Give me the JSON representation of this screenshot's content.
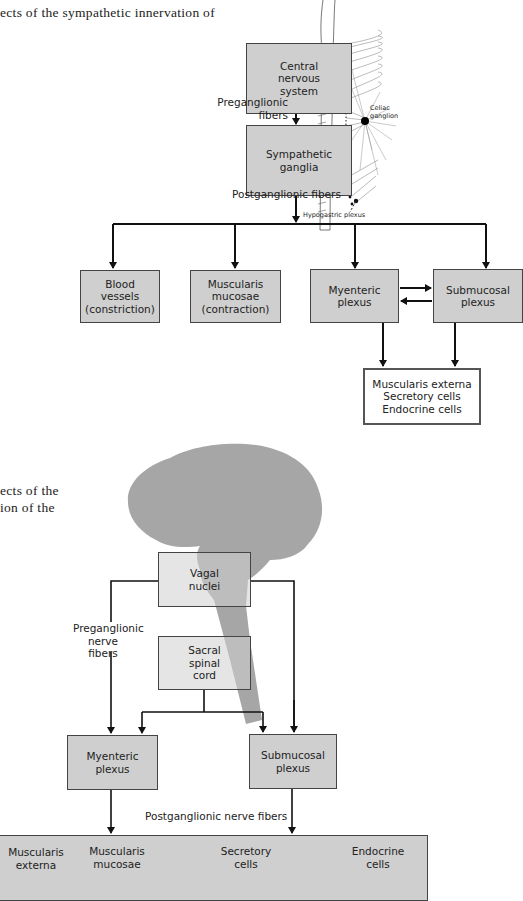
{
  "captions": {
    "top_fragment": "ects of the sympathetic innervation of",
    "bottom_fragment_line1": "ects of the",
    "bottom_fragment_line2": "ion of the"
  },
  "sympathetic_diagram": {
    "boxes": {
      "cns": "Central\nnervous\nsystem",
      "ganglia": "Sympathetic\nganglia",
      "blood_vessels": "Blood\nvessels\n(constriction)",
      "muscularis_mucosae": "Muscularis\nmucosae\n(contraction)",
      "myenteric": "Myenteric\nplexus",
      "submucosal": "Submucosal\nplexus",
      "effectors": "Muscularis externa\nSecretory cells\nEndocrine cells"
    },
    "labels": {
      "preganglionic": "Preganglionic\nfibers",
      "postganglionic": "Postganglionic fibers",
      "celiac": "Celiac\nganglion",
      "hypogastric": "Hypogastric plexus"
    }
  },
  "parasympathetic_diagram": {
    "boxes": {
      "vagal": "Vagal\nnuclei",
      "sacral": "Sacral\nspinal\ncord",
      "myenteric": "Myenteric\nplexus",
      "submucosal": "Submucosal\nplexus"
    },
    "labels": {
      "preganglionic": "Preganglionic\nnerve\nfibers",
      "postganglionic": "Postganglionic nerve fibers"
    },
    "targets": [
      "Muscularis\nexterna",
      "Muscularis\nmucosae",
      "Secretory\ncells",
      "Endocrine\ncells"
    ]
  },
  "colors": {
    "box_fill": "#cfcfcf",
    "brain_fill": "#a6a6a6",
    "line": "#111111"
  }
}
